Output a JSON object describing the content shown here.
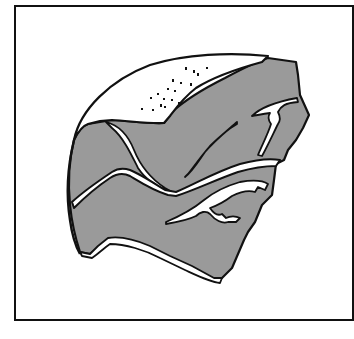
{
  "figure": {
    "type": "line-drawing",
    "colors": {
      "background": "#ffffff",
      "shading": "#9a9a9a",
      "outline": "#111111"
    }
  }
}
